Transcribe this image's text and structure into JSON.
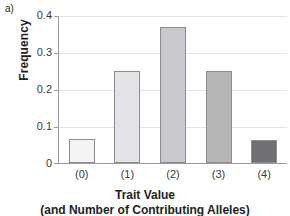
{
  "panel": {
    "label": "a)"
  },
  "chart_data": {
    "type": "bar",
    "title": "",
    "xlabel": "Trait Value",
    "xsublabel": "(and Number of Contributing Alleles)",
    "ylabel": "Frequency",
    "categories": [
      "(0)",
      "(1)",
      "(2)",
      "(3)",
      "(4)"
    ],
    "values": [
      0.065,
      0.25,
      0.37,
      0.25,
      0.062
    ],
    "ylim": [
      0,
      0.4
    ],
    "yticks": [
      "0",
      "0.1",
      "0.2",
      "0.3",
      "0.4"
    ],
    "ytick_values": [
      0,
      0.1,
      0.2,
      0.3,
      0.4
    ],
    "grid": true,
    "legend": "none",
    "bar_colors": [
      "#f4f4f6",
      "#e3e3e7",
      "#c9c9cd",
      "#b6b6b9",
      "#707074"
    ],
    "bar_border_color": "#8d8d90",
    "gridline_color": "#e4e4e6",
    "axis_color": "#9a9a9c",
    "text_color": "#231f20"
  }
}
